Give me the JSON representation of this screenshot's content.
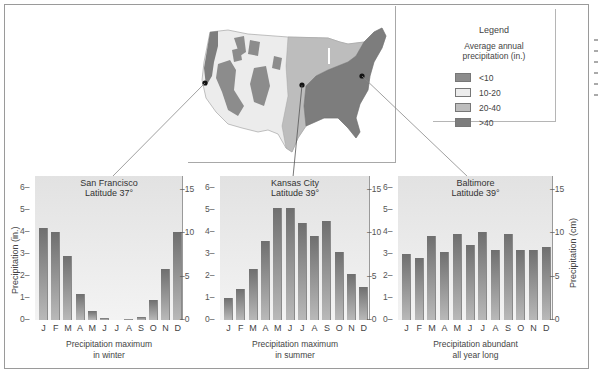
{
  "legend": {
    "title": "Legend",
    "subtitle_line1": "Average annual",
    "subtitle_line2": "precipitation (in.)",
    "items": [
      {
        "label": "<10",
        "color": "#8c8c8c"
      },
      {
        "label": "10-20",
        "color": "#ececec"
      },
      {
        "label": "20-40",
        "color": "#bdbdbd"
      },
      {
        "label": ">40",
        "color": "#7d7d7d"
      }
    ]
  },
  "axis": {
    "left_label": "Precipitation (in.)",
    "right_label": "Precipitation (cm)",
    "left_ticks": [
      "0",
      "1",
      "2",
      "3",
      "4",
      "5",
      "6"
    ],
    "right_ticks": [
      "0",
      "5",
      "10",
      "15"
    ],
    "months": [
      "J",
      "F",
      "M",
      "A",
      "M",
      "J",
      "J",
      "A",
      "S",
      "O",
      "N",
      "D"
    ]
  },
  "chart_data": [
    {
      "type": "bar",
      "title": "San Francisco",
      "subtitle": "Latitude 37°",
      "caption_line1": "Precipitation maximum",
      "caption_line2": "in winter",
      "categories": [
        "J",
        "F",
        "M",
        "A",
        "M",
        "J",
        "J",
        "A",
        "S",
        "O",
        "N",
        "D"
      ],
      "values": [
        4.2,
        4.0,
        2.9,
        1.2,
        0.4,
        0.1,
        0.0,
        0.05,
        0.15,
        0.9,
        2.3,
        4.0
      ],
      "ylabel": "Precipitation (in.)",
      "ylabel_right": "Precipitation (cm)",
      "ylim": [
        0,
        6.3
      ],
      "ylim_right": [
        0,
        16
      ]
    },
    {
      "type": "bar",
      "title": "Kansas City",
      "subtitle": "Latitude 39°",
      "caption_line1": "Precipitation maximum",
      "caption_line2": "in summer",
      "categories": [
        "J",
        "F",
        "M",
        "A",
        "M",
        "J",
        "J",
        "A",
        "S",
        "O",
        "N",
        "D"
      ],
      "values": [
        1.0,
        1.4,
        2.3,
        3.6,
        5.1,
        5.1,
        4.4,
        3.8,
        4.5,
        3.1,
        2.1,
        1.5
      ],
      "ylabel": "Precipitation (in.)",
      "ylabel_right": "Precipitation (cm)",
      "ylim": [
        0,
        6.3
      ],
      "ylim_right": [
        0,
        16
      ]
    },
    {
      "type": "bar",
      "title": "Baltimore",
      "subtitle": "Latitude 39°",
      "caption_line1": "Precipitation abundant",
      "caption_line2": "all year long",
      "categories": [
        "J",
        "F",
        "M",
        "A",
        "M",
        "J",
        "J",
        "A",
        "S",
        "O",
        "N",
        "D"
      ],
      "values": [
        3.0,
        2.8,
        3.8,
        3.1,
        3.9,
        3.4,
        4.0,
        3.2,
        3.9,
        3.2,
        3.2,
        3.3
      ],
      "ylabel": "Precipitation (in.)",
      "ylabel_right": "Precipitation (cm)",
      "ylim": [
        0,
        6.3
      ],
      "ylim_right": [
        0,
        16
      ]
    }
  ]
}
